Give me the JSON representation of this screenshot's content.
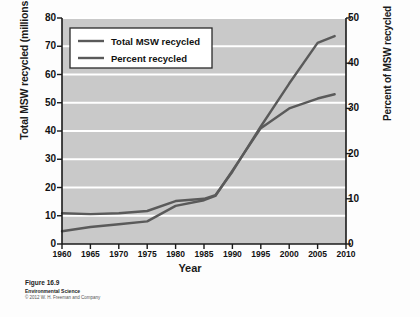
{
  "figure": {
    "number": "Figure 16.9",
    "book": "Environmental Science",
    "copyright": "© 2012 W. H. Freeman and Company"
  },
  "colors": {
    "plot_background": "#c9c9c9",
    "gridline": "#ffffff",
    "line": "#5a5a5a",
    "axis": "#1a1a1a",
    "legend_background": "#ffffff"
  },
  "legend": {
    "position": "top-left-inside",
    "entries": [
      {
        "label": "Total MSW recycled",
        "color": "#5a5a5a"
      },
      {
        "label": "Percent recycled",
        "color": "#5a5a5a"
      }
    ]
  },
  "chart_data": {
    "type": "line",
    "title": "",
    "subtitle": "",
    "xlabel": "Year",
    "ylabel": "Total MSW recycled (millions of metric tons)",
    "ylabel_right": "Percent of MSW recycled",
    "xlim": [
      1960,
      2010
    ],
    "ylim": [
      0,
      80
    ],
    "ylim_right": [
      0,
      50
    ],
    "xticks": [
      1960,
      1965,
      1970,
      1975,
      1980,
      1985,
      1990,
      1995,
      2000,
      2005,
      2010
    ],
    "yticks": [
      0,
      10,
      20,
      30,
      40,
      50,
      60,
      70,
      80
    ],
    "yticks_right": [
      0,
      10,
      20,
      30,
      40,
      50
    ],
    "grid": "horizontal",
    "x": [
      1960,
      1965,
      1970,
      1975,
      1980,
      1985,
      1987,
      1990,
      1995,
      2000,
      2005,
      2008
    ],
    "series": [
      {
        "name": "Total MSW recycled",
        "axis": "left",
        "units": "millions of metric tons",
        "color": "#5a5a5a",
        "values": [
          4.5,
          6.0,
          7.0,
          8.0,
          13.5,
          15.5,
          17.0,
          26.0,
          41.0,
          48.0,
          51.5,
          53.0
        ]
      },
      {
        "name": "Percent recycled",
        "axis": "right",
        "units": "percent",
        "color": "#5a5a5a",
        "values": [
          6.8,
          6.6,
          6.8,
          7.3,
          9.5,
          10.0,
          10.8,
          16.0,
          26.0,
          35.5,
          44.5,
          46.0
        ]
      }
    ]
  }
}
